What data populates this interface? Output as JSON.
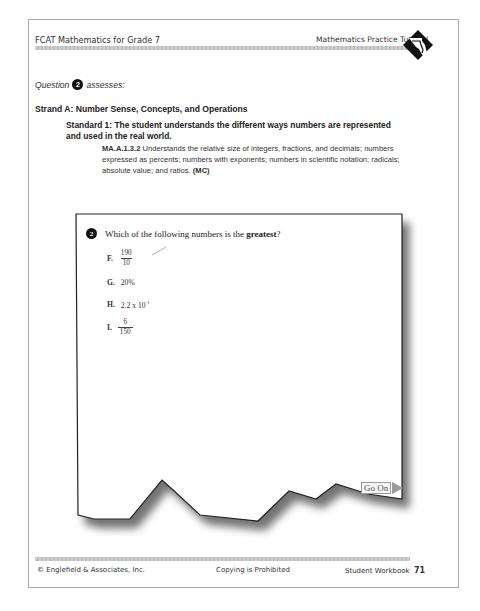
{
  "header": {
    "left": "FCAT Mathematics for Grade 7",
    "right": "Mathematics Practice Tutorial",
    "logo_icon": "state-outline-logo-icon"
  },
  "assessment": {
    "prefix": "Question",
    "question_number": "2",
    "suffix": "assesses:"
  },
  "strand": "Strand A: Number Sense, Concepts, and Operations",
  "standard": "Standard 1: The student understands the different ways numbers are represented and used in the real world.",
  "benchmark": {
    "code": "MA.A.1.3.2",
    "text": "Understands the relative size of integers, fractions, and decimals; numbers expressed as percents; numbers with exponents; numbers in scientific notation; radicals; absolute value; and ratios.",
    "type": "(MC)"
  },
  "question": {
    "number": "2",
    "text_before": "Which of the following numbers is the ",
    "text_bold": "greatest",
    "text_after": "?",
    "choices": [
      {
        "letter": "F.",
        "numerator": "190",
        "denominator": "10",
        "marked": true
      },
      {
        "letter": "G.",
        "value": "20%"
      },
      {
        "letter": "H.",
        "base": "2.2 x 10",
        "exponent": "-1"
      },
      {
        "letter": "I.",
        "numerator": "6",
        "denominator": "150"
      }
    ]
  },
  "go_on": {
    "label": "Go On",
    "icon": "arrow-right-icon"
  },
  "footer": {
    "left": "© Englefield & Associates, Inc.",
    "center": "Copying is Prohibited",
    "right_label": "Student Workbook",
    "page_number": "71"
  }
}
